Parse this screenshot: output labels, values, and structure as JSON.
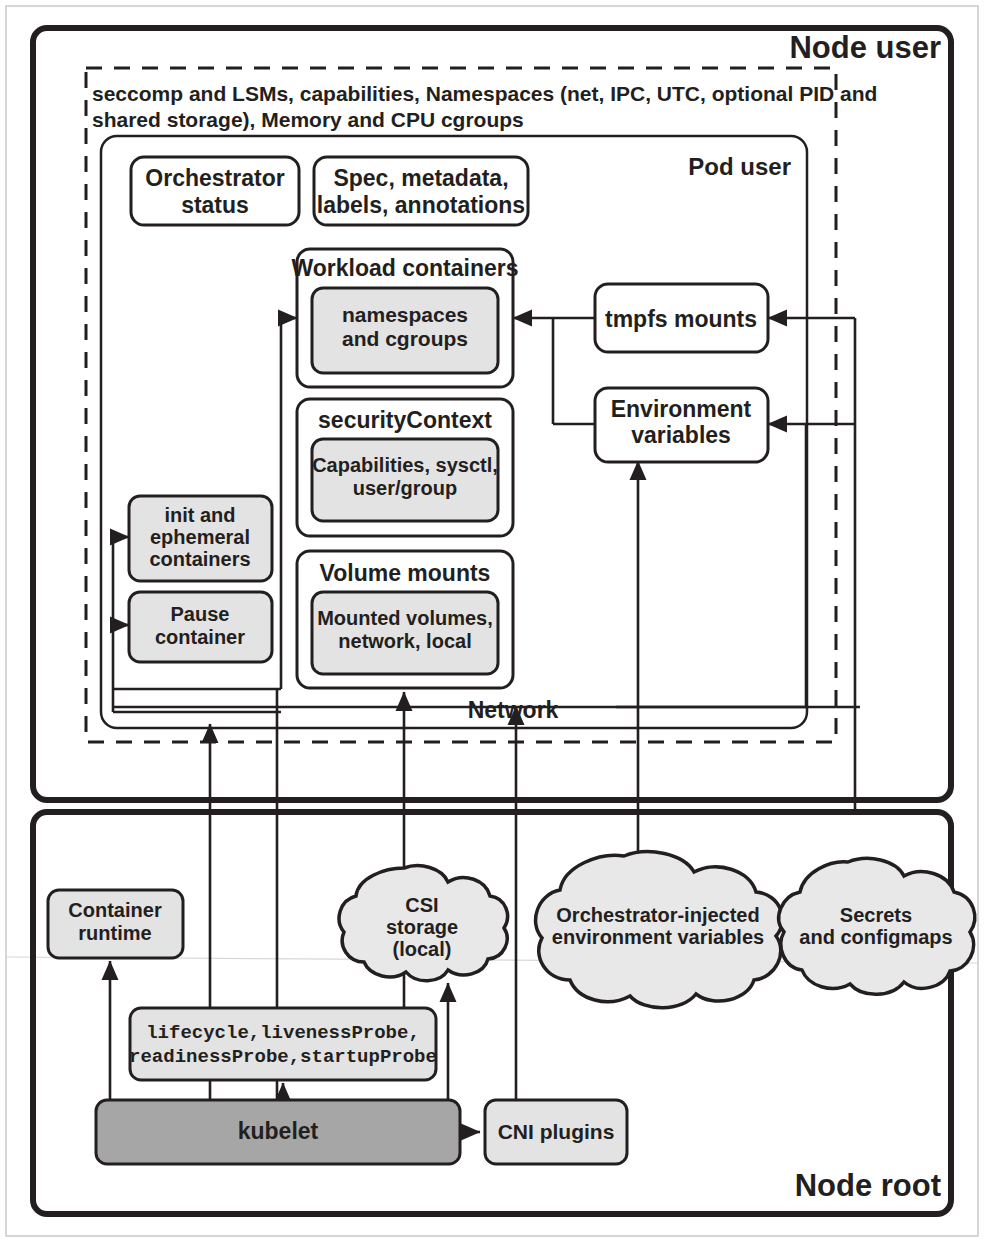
{
  "diagram": {
    "node_user_label": "Node user",
    "node_root_label": "Node root",
    "pod_user_label": "Pod user",
    "network_label": "Network",
    "dashed_boundary_text_line1": "seccomp and LSMs, capabilities, Namespaces (net, IPC, UTC, optional PID and",
    "dashed_boundary_text_line2": "shared storage), Memory and CPU cgroups"
  },
  "pod_boxes": {
    "orchestrator_status": "Orchestrator\nstatus",
    "orchestrator_status_l1": "Orchestrator",
    "orchestrator_status_l2": "status",
    "spec_metadata_l1": "Spec, metadata,",
    "spec_metadata_l2": "labels, annotations",
    "workload_containers_title": "Workload containers",
    "workload_inner_l1": "namespaces",
    "workload_inner_l2": "and cgroups",
    "security_context_title": "securityContext",
    "security_context_inner_l1": "Capabilities, sysctl,",
    "security_context_inner_l2": "user/group",
    "volume_mounts_title": "Volume mounts",
    "volume_mounts_inner_l1": "Mounted volumes,",
    "volume_mounts_inner_l2": "network, local",
    "init_ephemeral_l1": "init and",
    "init_ephemeral_l2": "ephemeral",
    "init_ephemeral_l3": "containers",
    "pause_container_l1": "Pause",
    "pause_container_l2": "container",
    "tmpfs_mounts": "tmpfs mounts",
    "env_variables_l1": "Environment",
    "env_variables_l2": "variables"
  },
  "node_root_boxes": {
    "container_runtime_l1": "Container",
    "container_runtime_l2": "runtime",
    "csi_storage_l1": "CSI",
    "csi_storage_l2": "storage",
    "csi_storage_l3": "(local)",
    "orchestrator_injected_l1": "Orchestrator-injected",
    "orchestrator_injected_l2": "environment variables",
    "secrets_configmaps_l1": "Secrets",
    "secrets_configmaps_l2": "and configmaps",
    "probes_l1": "lifecycle,livenessProbe,",
    "probes_l2": "readinessProbe,startupProbe",
    "kubelet": "kubelet",
    "cni_plugins": "CNI plugins"
  },
  "colors": {
    "ink": "#231f20",
    "gray_fill": "#e3e3e3",
    "dark_gray_fill": "#a6a6a6",
    "cloud_fill": "#e8e8e8",
    "white": "#ffffff"
  }
}
